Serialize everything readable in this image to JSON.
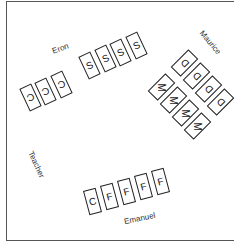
{
  "diagram": {
    "students": {
      "eron": {
        "name": "Eron"
      },
      "maurice": {
        "name": "Maurice"
      },
      "emanuel": {
        "name": "Emanuel"
      },
      "teacher": {
        "name": "Teacher"
      }
    },
    "eron_cards": [
      "C",
      "C",
      "C"
    ],
    "s_cards": [
      "S",
      "S",
      "S",
      "S"
    ],
    "maurice_d_cards": [
      "D",
      "D",
      "D",
      "D"
    ],
    "maurice_m_cards": [
      "M",
      "M",
      "M",
      "M"
    ],
    "emanuel_cards": [
      "C",
      "F",
      "F",
      "F",
      "F"
    ]
  }
}
